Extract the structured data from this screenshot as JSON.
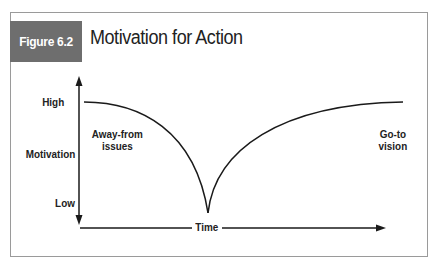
{
  "figure": {
    "label": "Figure 6.2",
    "title": "Motivation for Action"
  },
  "axes": {
    "y_label": "Motivation",
    "y_high": "High",
    "y_low": "Low",
    "x_label": "Time"
  },
  "annotations": {
    "left_line1": "Away-from",
    "left_line2": "issues",
    "right_line1": "Go-to",
    "right_line2": "vision"
  },
  "colors": {
    "label_bg": "#6e6e6e",
    "line": "#1a1a1a",
    "frame": "#9a9a9a"
  }
}
